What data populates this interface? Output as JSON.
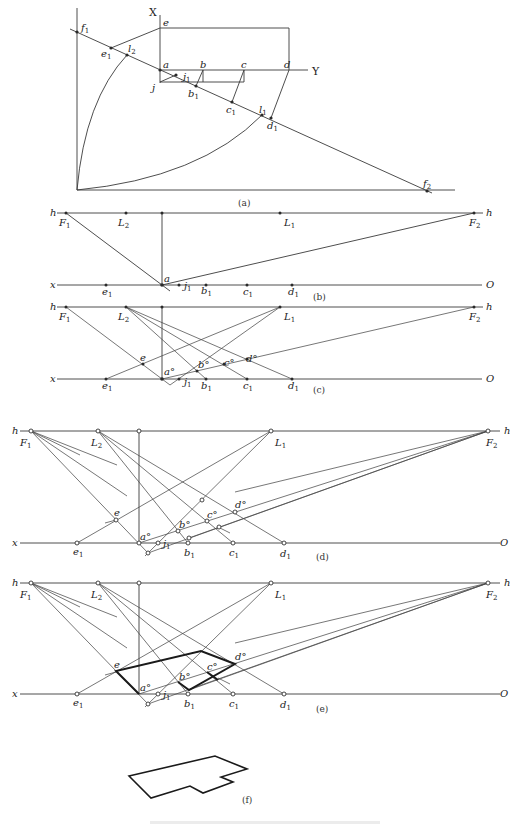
{
  "figure": {
    "panels": [
      {
        "id": "a",
        "caption": "(a)"
      },
      {
        "id": "b",
        "caption": "(b)"
      },
      {
        "id": "c",
        "caption": "(c)"
      },
      {
        "id": "d",
        "caption": "(d)"
      },
      {
        "id": "e",
        "caption": "(e)"
      },
      {
        "id": "f",
        "caption": "(f)"
      }
    ],
    "panel_a": {
      "axis_x": "X",
      "axis_y": "Y",
      "labels": {
        "f1": "f",
        "f1_sub": "1",
        "f2": "f",
        "f2_sub": "2",
        "e": "e",
        "e1": "e",
        "e1_sub": "1",
        "l2": "l",
        "l2_sub": "2",
        "l1": "l",
        "l1_sub": "1",
        "a": "a",
        "b": "b",
        "c": "c",
        "d": "d",
        "j": "j",
        "j1": "j",
        "j1_sub": "1",
        "b1": "b",
        "b1_sub": "1",
        "c1": "c",
        "c1_sub": "1",
        "d1": "d",
        "d1_sub": "1"
      }
    },
    "perspective_labels": {
      "h": "h",
      "x": "x",
      "O": "O",
      "F1": "F",
      "F1_sub": "1",
      "F2": "F",
      "F2_sub": "2",
      "L1": "L",
      "L1_sub": "1",
      "L2": "L",
      "L2_sub": "2",
      "a": "a",
      "a0": "a°",
      "b0": "b°",
      "c0": "c°",
      "d0": "d°",
      "e": "e",
      "e1": "e",
      "e1_sub": "1",
      "b1": "b",
      "b1_sub": "1",
      "c1": "c",
      "c1_sub": "1",
      "d1": "d",
      "d1_sub": "1",
      "j1": "j",
      "j1_sub": "1"
    },
    "bottom_caption": "(faint figure caption — illegible)"
  }
}
